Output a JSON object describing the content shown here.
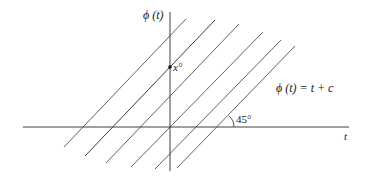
{
  "diagram": {
    "y_axis_label": "ϕ (t)",
    "x_axis_label": "t",
    "point_label": "x°",
    "equation_label": "ϕ (t) = t + c",
    "angle_label": "45°",
    "colors": {
      "line": "#3a3a3a",
      "axis": "#2a2a2a",
      "background": "#ffffff"
    },
    "axes": {
      "origin": [
        170,
        127
      ],
      "x_axis": {
        "from": [
          23,
          127
        ],
        "to": [
          349,
          127
        ]
      },
      "y_axis": {
        "from": [
          170,
          12
        ],
        "to": [
          170,
          171
        ]
      }
    },
    "family_lines": [
      {
        "from": [
          64,
          147
        ],
        "to": [
          186,
          19
        ]
      },
      {
        "from": [
          85,
          156
        ],
        "to": [
          215,
          20
        ]
      },
      {
        "from": [
          106,
          163
        ],
        "to": [
          239,
          24
        ]
      },
      {
        "from": [
          131,
          167
        ],
        "to": [
          263,
          32
        ]
      },
      {
        "from": [
          155,
          169
        ],
        "to": [
          281,
          40
        ]
      },
      {
        "from": [
          177,
          168
        ],
        "to": [
          295,
          46
        ]
      }
    ],
    "marked_point": [
      170,
      67
    ]
  }
}
